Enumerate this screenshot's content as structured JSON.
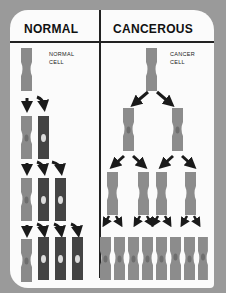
{
  "headers": {
    "left": "NORMAL",
    "right": "CANCEROUS"
  },
  "labels": {
    "normal_cell": [
      "NORMAL",
      "CELL"
    ],
    "cancer_cell": [
      "CANCER",
      "CELL"
    ]
  },
  "colors": {
    "background": "#9a9a9a",
    "card": "#fbfbfb",
    "normal_cell": "#8a8a8a",
    "differentiated_cell": "#444444",
    "cancer_cell": "#8c8c8c",
    "nucleus_light": "#dcdcdc",
    "nucleus_dark": "#6e6e6e",
    "arrow": "#1a1a1a"
  },
  "normal_generations": [
    1,
    2,
    3,
    4
  ],
  "cancer_generations": [
    1,
    2,
    4,
    8
  ]
}
